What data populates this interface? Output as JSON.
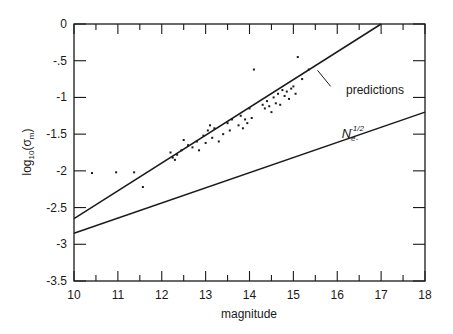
{
  "chart_data": {
    "type": "scatter",
    "title": "",
    "xlabel": "magnitude",
    "ylabel": "log10(σm)",
    "ylabel_parts": {
      "base": "log",
      "sub": "10",
      "open": "(σ",
      "sub2": "m",
      "close": ")"
    },
    "xlim": [
      10,
      18
    ],
    "ylim": [
      -3.5,
      0
    ],
    "grid": false,
    "legend": "none",
    "x_ticks": [
      10,
      11,
      12,
      13,
      14,
      15,
      16,
      17,
      18
    ],
    "x_tick_labels": [
      "10",
      "11",
      "12",
      "13",
      "14",
      "15",
      "16",
      "17",
      "18"
    ],
    "y_ticks": [
      0,
      -0.5,
      -1,
      -1.5,
      -2,
      -2.5,
      -3,
      -3.5
    ],
    "y_tick_labels": [
      "0",
      "-.5",
      "-1",
      "-1.5",
      "-2",
      "-2.5",
      "-3",
      "-3.5"
    ],
    "series": [
      {
        "name": "observations",
        "kind": "scatter",
        "points": [
          [
            10.41,
            -2.03
          ],
          [
            10.96,
            -2.02
          ],
          [
            11.37,
            -2.02
          ],
          [
            11.57,
            -2.22
          ],
          [
            12.2,
            -1.75
          ],
          [
            12.25,
            -1.82
          ],
          [
            12.3,
            -1.85
          ],
          [
            12.35,
            -1.78
          ],
          [
            12.45,
            -1.72
          ],
          [
            12.5,
            -1.58
          ],
          [
            12.6,
            -1.65
          ],
          [
            12.7,
            -1.68
          ],
          [
            12.8,
            -1.6
          ],
          [
            12.85,
            -1.72
          ],
          [
            12.95,
            -1.52
          ],
          [
            13.0,
            -1.62
          ],
          [
            13.05,
            -1.45
          ],
          [
            13.1,
            -1.38
          ],
          [
            13.15,
            -1.55
          ],
          [
            13.2,
            -1.42
          ],
          [
            13.3,
            -1.6
          ],
          [
            13.4,
            -1.5
          ],
          [
            13.5,
            -1.35
          ],
          [
            13.55,
            -1.45
          ],
          [
            13.6,
            -1.3
          ],
          [
            13.75,
            -1.38
          ],
          [
            13.8,
            -1.25
          ],
          [
            13.85,
            -1.42
          ],
          [
            13.9,
            -1.3
          ],
          [
            13.95,
            -1.35
          ],
          [
            14.0,
            -1.15
          ],
          [
            14.1,
            -0.62
          ],
          [
            14.05,
            -1.28
          ],
          [
            14.3,
            -1.1
          ],
          [
            14.35,
            -1.15
          ],
          [
            14.4,
            -1.05
          ],
          [
            14.45,
            -1.12
          ],
          [
            14.5,
            -1.2
          ],
          [
            14.55,
            -1.0
          ],
          [
            14.6,
            -1.08
          ],
          [
            14.65,
            -0.95
          ],
          [
            14.7,
            -1.1
          ],
          [
            14.75,
            -0.9
          ],
          [
            14.8,
            -0.98
          ],
          [
            14.85,
            -0.92
          ],
          [
            14.9,
            -1.02
          ],
          [
            14.95,
            -0.88
          ],
          [
            15.0,
            -0.85
          ],
          [
            15.05,
            -0.95
          ],
          [
            15.1,
            -0.45
          ],
          [
            15.2,
            -0.75
          ],
          [
            15.35,
            -0.62
          ]
        ]
      },
      {
        "name": "predictions",
        "kind": "line",
        "points": [
          [
            10,
            -2.65
          ],
          [
            17,
            0
          ]
        ]
      },
      {
        "name": "Ne-^-1/2",
        "kind": "line",
        "points": [
          [
            10,
            -2.85
          ],
          [
            18,
            -1.2
          ]
        ]
      }
    ],
    "annotations": [
      {
        "text": "predictions",
        "x": 16.2,
        "y": -0.95,
        "leader_from": [
          15.85,
          -0.85
        ],
        "leader_to": [
          15.55,
          -0.63
        ]
      },
      {
        "text": "N",
        "sub": "e-",
        "sup": "-1/2",
        "x": 16.1,
        "y": -1.55
      }
    ]
  }
}
